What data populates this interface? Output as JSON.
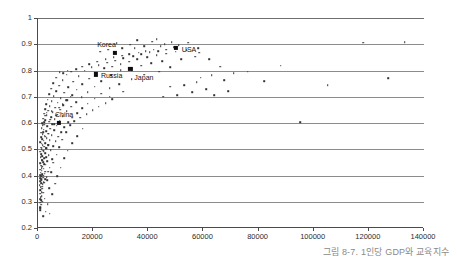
{
  "caption": "그림 8-7. 1인당 GDP와 교육지수",
  "colors": {
    "background": "#ffffff",
    "gridline": "#8c8c8c",
    "axis": "#4a4a4a",
    "point": "#333333",
    "highlight_point": "#0d0d0d",
    "caption_text": "#8a8a8a",
    "tick_text": "#2b2b2b"
  },
  "chart_data": {
    "type": "scatter",
    "title": "",
    "subtitle": "",
    "xlabel": "",
    "ylabel": "",
    "xlim": [
      0,
      140000
    ],
    "ylim": [
      0.2,
      1.0
    ],
    "xticks": [
      0,
      20000,
      40000,
      60000,
      80000,
      100000,
      120000,
      140000
    ],
    "xtick_labels": [
      "0",
      "20000",
      "40000",
      "60000",
      "80000",
      "100000",
      "120000",
      "140000"
    ],
    "yticks": [
      0.2,
      0.3,
      0.4,
      0.5,
      0.6,
      0.7,
      0.8,
      0.9,
      1.0
    ],
    "ytick_labels": [
      "0.2",
      "0.3",
      "0.4",
      "0.5",
      "0.6",
      "0.7",
      "0.8",
      "0.9",
      "1"
    ],
    "grid": "horizontal",
    "legend": "none",
    "annotations": [
      {
        "label": "Korea",
        "x": 28000,
        "y": 0.866,
        "label_dx": -18,
        "label_dy": -8
      },
      {
        "label": "USA",
        "x": 50000,
        "y": 0.886,
        "label_dx": 6,
        "label_dy": 2
      },
      {
        "label": "Russia",
        "x": 21000,
        "y": 0.785,
        "label_dx": 5,
        "label_dy": 2
      },
      {
        "label": "Japan",
        "x": 33500,
        "y": 0.806,
        "label_dx": 4,
        "label_dy": 9
      },
      {
        "label": "China",
        "x": 7600,
        "y": 0.601,
        "label_dx": -4,
        "label_dy": -8
      }
    ],
    "highlighted": [
      {
        "name": "Korea",
        "x": 28000,
        "y": 0.866
      },
      {
        "name": "USA",
        "x": 50000,
        "y": 0.886
      },
      {
        "name": "Russia",
        "x": 21000,
        "y": 0.785
      },
      {
        "name": "Japan",
        "x": 33500,
        "y": 0.806
      },
      {
        "name": "China",
        "x": 7600,
        "y": 0.601
      }
    ],
    "points": [
      [
        700,
        0.268
      ],
      [
        900,
        0.279
      ],
      [
        800,
        0.296
      ],
      [
        1100,
        0.305
      ],
      [
        950,
        0.318
      ],
      [
        700,
        0.331
      ],
      [
        1300,
        0.337
      ],
      [
        850,
        0.344
      ],
      [
        1500,
        0.35
      ],
      [
        1000,
        0.356
      ],
      [
        600,
        0.362
      ],
      [
        1700,
        0.366
      ],
      [
        1200,
        0.371
      ],
      [
        2100,
        0.374
      ],
      [
        800,
        0.379
      ],
      [
        1400,
        0.383
      ],
      [
        2600,
        0.385
      ],
      [
        900,
        0.389
      ],
      [
        1900,
        0.392
      ],
      [
        3200,
        0.394
      ],
      [
        1100,
        0.397
      ],
      [
        700,
        0.401
      ],
      [
        1600,
        0.404
      ],
      [
        2400,
        0.407
      ],
      [
        1000,
        0.411
      ],
      [
        3600,
        0.414
      ],
      [
        1300,
        0.418
      ],
      [
        800,
        0.422
      ],
      [
        2000,
        0.426
      ],
      [
        4200,
        0.429
      ],
      [
        1500,
        0.433
      ],
      [
        1100,
        0.437
      ],
      [
        2800,
        0.441
      ],
      [
        900,
        0.446
      ],
      [
        1800,
        0.451
      ],
      [
        3400,
        0.455
      ],
      [
        1300,
        0.459
      ],
      [
        5100,
        0.462
      ],
      [
        2200,
        0.466
      ],
      [
        1000,
        0.47
      ],
      [
        1600,
        0.474
      ],
      [
        3900,
        0.478
      ],
      [
        1200,
        0.482
      ],
      [
        2600,
        0.486
      ],
      [
        900,
        0.49
      ],
      [
        1900,
        0.494
      ],
      [
        4600,
        0.497
      ],
      [
        1400,
        0.5
      ],
      [
        3000,
        0.503
      ],
      [
        1100,
        0.506
      ],
      [
        2300,
        0.509
      ],
      [
        5600,
        0.512
      ],
      [
        1700,
        0.515
      ],
      [
        3700,
        0.518
      ],
      [
        1300,
        0.521
      ],
      [
        2700,
        0.524
      ],
      [
        900,
        0.527
      ],
      [
        6400,
        0.53
      ],
      [
        2000,
        0.533
      ],
      [
        4300,
        0.536
      ],
      [
        1500,
        0.539
      ],
      [
        3200,
        0.542
      ],
      [
        1100,
        0.545
      ],
      [
        7300,
        0.548
      ],
      [
        2400,
        0.551
      ],
      [
        5000,
        0.554
      ],
      [
        1700,
        0.557
      ],
      [
        3800,
        0.56
      ],
      [
        1200,
        0.563
      ],
      [
        8400,
        0.566
      ],
      [
        2900,
        0.569
      ],
      [
        5900,
        0.572
      ],
      [
        2000,
        0.575
      ],
      [
        4400,
        0.578
      ],
      [
        1400,
        0.581
      ],
      [
        9600,
        0.584
      ],
      [
        3400,
        0.587
      ],
      [
        6800,
        0.59
      ],
      [
        2300,
        0.593
      ],
      [
        5200,
        0.596
      ],
      [
        1600,
        0.599
      ],
      [
        11000,
        0.602
      ],
      [
        4000,
        0.605
      ],
      [
        7800,
        0.608
      ],
      [
        2700,
        0.611
      ],
      [
        6000,
        0.614
      ],
      [
        1900,
        0.617
      ],
      [
        12500,
        0.62
      ],
      [
        4700,
        0.623
      ],
      [
        9000,
        0.626
      ],
      [
        3100,
        0.629
      ],
      [
        6900,
        0.632
      ],
      [
        2200,
        0.635
      ],
      [
        14200,
        0.638
      ],
      [
        5400,
        0.641
      ],
      [
        10400,
        0.644
      ],
      [
        3600,
        0.647
      ],
      [
        8000,
        0.65
      ],
      [
        2600,
        0.653
      ],
      [
        16000,
        0.656
      ],
      [
        6200,
        0.659
      ],
      [
        12000,
        0.662
      ],
      [
        4200,
        0.665
      ],
      [
        9200,
        0.668
      ],
      [
        3000,
        0.671
      ],
      [
        18000,
        0.674
      ],
      [
        7100,
        0.677
      ],
      [
        13800,
        0.68
      ],
      [
        4900,
        0.683
      ],
      [
        10600,
        0.686
      ],
      [
        3500,
        0.689
      ],
      [
        20500,
        0.692
      ],
      [
        8200,
        0.695
      ],
      [
        15800,
        0.698
      ],
      [
        5700,
        0.701
      ],
      [
        26000,
        0.7
      ],
      [
        12300,
        0.706
      ],
      [
        4100,
        0.709
      ],
      [
        23000,
        0.712
      ],
      [
        9500,
        0.715
      ],
      [
        18000,
        0.718
      ],
      [
        6600,
        0.721
      ],
      [
        31000,
        0.72
      ],
      [
        14000,
        0.727
      ],
      [
        4800,
        0.73
      ],
      [
        26000,
        0.733
      ],
      [
        11000,
        0.736
      ],
      [
        20500,
        0.739
      ],
      [
        7700,
        0.742
      ],
      [
        16000,
        0.748
      ],
      [
        5600,
        0.751
      ],
      [
        29500,
        0.748
      ],
      [
        12800,
        0.757
      ],
      [
        23000,
        0.76
      ],
      [
        9000,
        0.763
      ],
      [
        18500,
        0.769
      ],
      [
        6600,
        0.772
      ],
      [
        34000,
        0.766
      ],
      [
        14800,
        0.778
      ],
      [
        26500,
        0.781
      ],
      [
        10400,
        0.784
      ],
      [
        21000,
        0.79
      ],
      [
        7800,
        0.793
      ],
      [
        38500,
        0.784
      ],
      [
        17000,
        0.799
      ],
      [
        30000,
        0.802
      ],
      [
        12000,
        0.795
      ],
      [
        24000,
        0.808
      ],
      [
        9200,
        0.789
      ],
      [
        44000,
        0.796
      ],
      [
        19500,
        0.812
      ],
      [
        34000,
        0.8
      ],
      [
        13800,
        0.806
      ],
      [
        27000,
        0.815
      ],
      [
        10800,
        0.8
      ],
      [
        48000,
        0.812
      ],
      [
        22000,
        0.82
      ],
      [
        37500,
        0.818
      ],
      [
        16000,
        0.815
      ],
      [
        30000,
        0.824
      ],
      [
        25000,
        0.829
      ],
      [
        41000,
        0.828
      ],
      [
        18500,
        0.825
      ],
      [
        33000,
        0.833
      ],
      [
        28000,
        0.838
      ],
      [
        45000,
        0.836
      ],
      [
        21500,
        0.834
      ],
      [
        36000,
        0.842
      ],
      [
        31000,
        0.846
      ],
      [
        52000,
        0.844
      ],
      [
        24500,
        0.843
      ],
      [
        39500,
        0.851
      ],
      [
        34500,
        0.855
      ],
      [
        57000,
        0.852
      ],
      [
        27500,
        0.85
      ],
      [
        43000,
        0.858
      ],
      [
        37500,
        0.862
      ],
      [
        30500,
        0.857
      ],
      [
        46500,
        0.864
      ],
      [
        40500,
        0.869
      ],
      [
        33000,
        0.862
      ],
      [
        50000,
        0.872
      ],
      [
        43500,
        0.874
      ],
      [
        36500,
        0.868
      ],
      [
        54000,
        0.878
      ],
      [
        46500,
        0.88
      ],
      [
        39000,
        0.874
      ],
      [
        58000,
        0.884
      ],
      [
        42000,
        0.88
      ],
      [
        49500,
        0.888
      ],
      [
        35000,
        0.884
      ],
      [
        44500,
        0.893
      ],
      [
        51000,
        0.896
      ],
      [
        38500,
        0.893
      ],
      [
        46000,
        0.901
      ],
      [
        28500,
        0.905
      ],
      [
        41500,
        0.91
      ],
      [
        33500,
        0.898
      ],
      [
        48500,
        0.908
      ],
      [
        36000,
        0.915
      ],
      [
        54500,
        0.906
      ],
      [
        43000,
        0.92
      ],
      [
        30500,
        0.885
      ],
      [
        25500,
        0.88
      ],
      [
        22500,
        0.872
      ],
      [
        58500,
        0.868
      ],
      [
        62000,
        0.842
      ],
      [
        66000,
        0.815
      ],
      [
        63000,
        0.782
      ],
      [
        59000,
        0.773
      ],
      [
        71000,
        0.79
      ],
      [
        67500,
        0.762
      ],
      [
        57500,
        0.755
      ],
      [
        53000,
        0.744
      ],
      [
        48000,
        0.738
      ],
      [
        61000,
        0.728
      ],
      [
        56000,
        0.718
      ],
      [
        50500,
        0.706
      ],
      [
        45500,
        0.7
      ],
      [
        64000,
        0.706
      ],
      [
        69000,
        0.722
      ],
      [
        76000,
        0.796
      ],
      [
        82000,
        0.76
      ],
      [
        88000,
        0.818
      ],
      [
        95000,
        0.604
      ],
      [
        105000,
        0.744
      ],
      [
        118000,
        0.906
      ],
      [
        127000,
        0.77
      ],
      [
        133000,
        0.908
      ],
      [
        4300,
        0.255
      ],
      [
        2800,
        0.262
      ],
      [
        1800,
        0.246
      ],
      [
        3500,
        0.29
      ],
      [
        2400,
        0.312
      ],
      [
        5200,
        0.328
      ],
      [
        4000,
        0.352
      ],
      [
        6200,
        0.368
      ],
      [
        3300,
        0.382
      ],
      [
        7000,
        0.398
      ],
      [
        4800,
        0.412
      ],
      [
        8200,
        0.43
      ],
      [
        5600,
        0.448
      ],
      [
        9400,
        0.465
      ],
      [
        6800,
        0.48
      ],
      [
        10800,
        0.494
      ],
      [
        7600,
        0.508
      ],
      [
        12400,
        0.522
      ],
      [
        8800,
        0.536
      ],
      [
        14200,
        0.55
      ],
      [
        10200,
        0.564
      ],
      [
        16200,
        0.578
      ],
      [
        11600,
        0.592
      ],
      [
        13200,
        0.606
      ],
      [
        15200,
        0.62
      ],
      [
        17600,
        0.634
      ],
      [
        19800,
        0.648
      ],
      [
        22000,
        0.662
      ],
      [
        24500,
        0.676
      ],
      [
        27000,
        0.69
      ],
      [
        3900,
        0.56
      ],
      [
        2700,
        0.548
      ],
      [
        5800,
        0.596
      ],
      [
        4400,
        0.612
      ],
      [
        6600,
        0.628
      ],
      [
        5000,
        0.644
      ],
      [
        7600,
        0.658
      ],
      [
        8900,
        0.672
      ],
      [
        10200,
        0.686
      ],
      [
        11800,
        0.7
      ],
      [
        2200,
        0.604
      ],
      [
        1700,
        0.592
      ],
      [
        2600,
        0.628
      ],
      [
        3100,
        0.64
      ],
      [
        1900,
        0.566
      ],
      [
        2900,
        0.504
      ],
      [
        2100,
        0.492
      ],
      [
        3600,
        0.516
      ],
      [
        4300,
        0.532
      ],
      [
        3000,
        0.47
      ],
      [
        1600,
        0.458
      ],
      [
        2300,
        0.442
      ],
      [
        1400,
        0.428
      ],
      [
        2700,
        0.414
      ],
      [
        1900,
        0.4
      ],
      [
        1200,
        0.386
      ],
      [
        2200,
        0.372
      ],
      [
        1600,
        0.358
      ],
      [
        1000,
        0.346
      ],
      [
        1800,
        0.334
      ],
      [
        1300,
        0.322
      ],
      [
        900,
        0.31
      ],
      [
        1500,
        0.3
      ],
      [
        1100,
        0.288
      ],
      [
        700,
        0.276
      ]
    ]
  }
}
